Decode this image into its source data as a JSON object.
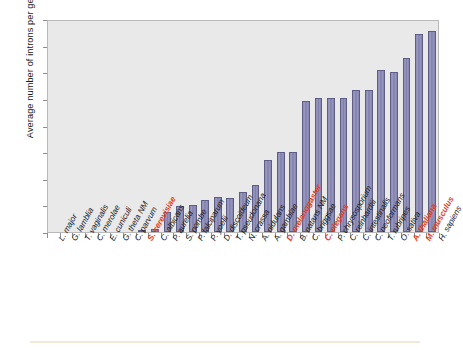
{
  "chart_data": {
    "type": "bar",
    "title": "",
    "xlabel": "",
    "ylabel": "Average number of introns per gene",
    "ylim": [
      0,
      8
    ],
    "yticks": [
      0,
      1,
      2,
      3,
      4,
      5,
      6,
      7,
      8
    ],
    "grid": false,
    "legend": null,
    "bar_color": "#8686b3",
    "bar_edge_color": "#5d5d86",
    "plot_background": "#e9e9e9",
    "highlight_color": "#e2401c",
    "categories": [
      "L. major",
      "G. lamblia",
      "T. vaginalis",
      "C. merolae",
      "E. cuniculi",
      "G. theta NM",
      "C. parvum",
      "S. cerevisiae",
      "C. albicans",
      "P. aurelia",
      "S. pombe",
      "P. falciparum",
      "P. yoelii",
      "D. discoideum",
      "T. pseudonana",
      "N. crassa",
      "A. nidulans",
      "A. gambiae",
      "D. melanogaster",
      "B. natans NM",
      "C. briggsae",
      "C. elegans",
      "P. chrysosporium",
      "C. reinhardtii",
      "C. intestinalis",
      "C. neoformans",
      "T. rubripes",
      "O. sativa",
      "A. thaliana",
      "M. musculus",
      "H. sapiens"
    ],
    "values": [
      0,
      0,
      0,
      0,
      0,
      0,
      0,
      0.08,
      0.11,
      0.77,
      0.98,
      1.0,
      1.2,
      1.3,
      1.28,
      1.5,
      1.75,
      2.72,
      3.02,
      3.02,
      4.93,
      5.02,
      5.02,
      5.04,
      5.33,
      5.33,
      6.07,
      6.02,
      6.55,
      7.45,
      7.56
    ],
    "highlighted_categories": [
      "S. cerevisiae",
      "D. melanogaster",
      "C. elegans",
      "A. thaliana",
      "M. musculus"
    ]
  }
}
